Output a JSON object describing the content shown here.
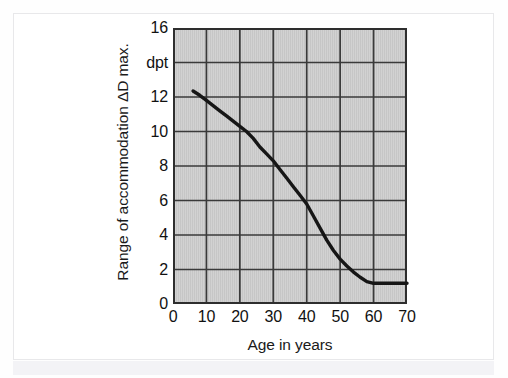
{
  "figure": {
    "kind": "line-chart-figure",
    "frame_color": "#e8e8ea",
    "plot_background_color": "#c9c9c9",
    "grid_color": "#3a3a3a",
    "curve_color": "#161616"
  },
  "chart_data": {
    "type": "line",
    "title": "",
    "subtitle": "",
    "xlabel": "Age in years",
    "ylabel": "Range of accommodation ΔD max.",
    "yunit": "dpt",
    "xlim": [
      0,
      70
    ],
    "ylim": [
      0,
      16
    ],
    "xticks": [
      0,
      10,
      20,
      30,
      40,
      50,
      60,
      70
    ],
    "xtick_labels": [
      "0",
      "10",
      "20",
      "30",
      "40",
      "50",
      "60",
      "70"
    ],
    "yticks": [
      0,
      2,
      4,
      6,
      8,
      10,
      12,
      14,
      16
    ],
    "ytick_labels": [
      "0",
      "2",
      "4",
      "6",
      "8",
      "10",
      "12",
      "dpt",
      "16"
    ],
    "grid": true,
    "grid_x_step": 10,
    "grid_y_step": 2,
    "legend": null,
    "legend_position": "none",
    "annotations": [],
    "series": [
      {
        "name": "Maximum range of accommodation",
        "x": [
          6,
          8,
          10,
          12,
          14,
          16,
          18,
          20,
          22,
          24,
          26,
          28,
          30,
          32,
          34,
          36,
          38,
          40,
          42,
          44,
          46,
          48,
          50,
          52,
          54,
          56,
          58,
          60,
          62,
          64,
          66,
          68,
          70
        ],
        "values": [
          12.35,
          12.1,
          11.8,
          11.5,
          11.2,
          10.9,
          10.6,
          10.3,
          10.0,
          9.6,
          9.1,
          8.7,
          8.3,
          7.8,
          7.3,
          6.8,
          6.3,
          5.8,
          5.1,
          4.4,
          3.7,
          3.1,
          2.6,
          2.2,
          1.85,
          1.55,
          1.3,
          1.2,
          1.2,
          1.2,
          1.2,
          1.2,
          1.2
        ]
      }
    ]
  }
}
